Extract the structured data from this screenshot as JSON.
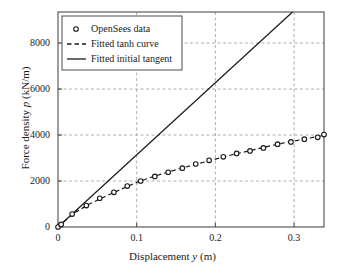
{
  "chart_data": {
    "type": "scatter",
    "title": "",
    "xlabel_plain": "Displacement y (m)",
    "ylabel_plain": "Force density p (kN/m)",
    "xlabel_parts": {
      "pre": "Displacement ",
      "italic": "y",
      "post": " (m)"
    },
    "ylabel_parts": {
      "pre": "Force density ",
      "italic": "p",
      "post": " (kN/m)"
    },
    "xlim": [
      0,
      0.338
    ],
    "ylim": [
      0,
      9350
    ],
    "xticks": [
      0,
      0.1,
      0.2,
      0.3
    ],
    "xtick_labels": [
      "0",
      "0.1",
      "0.2",
      "0.3"
    ],
    "yticks": [
      0,
      2000,
      4000,
      6000,
      8000
    ],
    "ytick_labels": [
      "0",
      "2000",
      "4000",
      "6000",
      "8000"
    ],
    "grid": true,
    "grid_style": "dashed",
    "grid_color": "#9a9a9a",
    "axes_color": "#4d4d4d",
    "legend_position": "upper-left",
    "series": [
      {
        "name": "OpenSees data",
        "type": "scatter",
        "marker": "circle-open",
        "color": "#1a1a1a",
        "x": [
          0.0,
          0.004,
          0.018,
          0.036,
          0.053,
          0.071,
          0.088,
          0.105,
          0.123,
          0.14,
          0.158,
          0.175,
          0.192,
          0.21,
          0.227,
          0.244,
          0.261,
          0.279,
          0.296,
          0.313,
          0.33,
          0.338
        ],
        "y": [
          0,
          110,
          560,
          930,
          1250,
          1510,
          1780,
          2000,
          2200,
          2380,
          2560,
          2740,
          2900,
          3050,
          3200,
          3310,
          3440,
          3600,
          3700,
          3820,
          3900,
          4020
        ]
      },
      {
        "name": "Fitted tanh curve",
        "type": "line",
        "style": "dashed",
        "color": "#1a1a1a",
        "x": [
          0.0,
          0.02,
          0.04,
          0.06,
          0.08,
          0.1,
          0.12,
          0.14,
          0.16,
          0.18,
          0.2,
          0.22,
          0.24,
          0.26,
          0.28,
          0.3,
          0.32,
          0.338
        ],
        "y": [
          0,
          600,
          1000,
          1330,
          1640,
          1940,
          2180,
          2390,
          2590,
          2770,
          2950,
          3130,
          3290,
          3450,
          3610,
          3740,
          3870,
          3990
        ]
      },
      {
        "name": "Fitted initial tangent",
        "type": "line",
        "style": "solid",
        "color": "#1a1a1a",
        "slope": 31400,
        "x": [
          0.0,
          0.298
        ],
        "y": [
          0,
          9350
        ]
      }
    ],
    "legend_entries": [
      {
        "label": "OpenSees data",
        "glyph": "circle-open"
      },
      {
        "label": "Fitted tanh curve",
        "glyph": "dashed-line"
      },
      {
        "label": "Fitted initial tangent",
        "glyph": "solid-line"
      }
    ]
  }
}
